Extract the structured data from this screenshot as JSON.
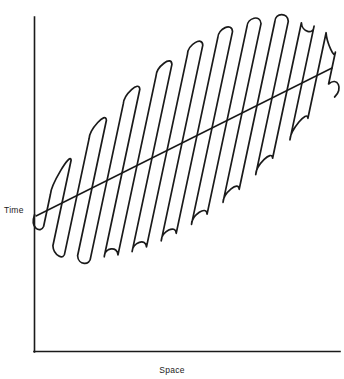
{
  "figure": {
    "width": 344,
    "height": 379,
    "background": "#ffffff",
    "stroke_color": "#1a1a1a",
    "axis_color": "#1a1a1a"
  },
  "axes": {
    "y_label": "Time",
    "x_label": "Space",
    "origin_x": 34,
    "origin_y": 352,
    "y_top": 17,
    "x_right": 340,
    "ticks": [],
    "tick_labels": []
  },
  "chart_data": {
    "type": "line",
    "title": "",
    "subtitle": "",
    "xlabel": "Space",
    "ylabel": "Time",
    "xlim": [
      34,
      340
    ],
    "ylim": [
      352,
      17
    ],
    "grid": false,
    "legend": "none",
    "annotations": [],
    "series": [
      {
        "name": "trend-line",
        "description": "straight diagonal trend line rising left to right",
        "x": [
          36,
          332
        ],
        "y": [
          216,
          68
        ]
      },
      {
        "name": "serpentine-path",
        "description": "continuous switchback (boustrophedon) curve whose amplitude envelope forms a lens shape centred on the trend line",
        "stroke_count": 20,
        "pitch": 15.2,
        "tilt_degrees": 12,
        "start_x": 47,
        "end_x": 332,
        "envelope_center_start_y": 216,
        "envelope_center_end_y": 68,
        "max_half_amplitude": 98,
        "top_extent_y": 29,
        "bottom_extent_y": 245
      }
    ]
  }
}
